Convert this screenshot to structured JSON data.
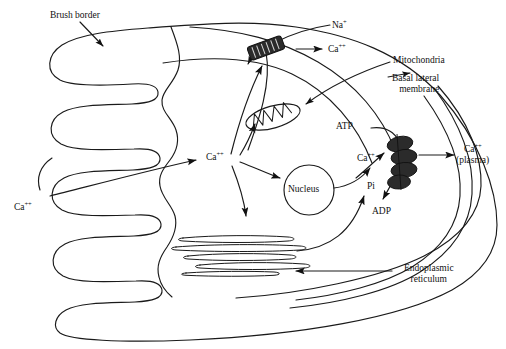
{
  "figure": {
    "background_color": "#ffffff",
    "stroke_color": "#1a1a1a",
    "fill_dark": "#2b2b2b"
  },
  "labels": {
    "brush_border": "Brush border",
    "na_plus": "Na",
    "na_plus_charge": "+",
    "ca_apical": "Ca",
    "ca_apical_charge": "++",
    "mitochondria": "Mitochondria",
    "basal_lateral_membrane_line1": "Basal lateral",
    "basal_lateral_membrane_line2": "membrane",
    "atp": "ATP",
    "adp": "ADP",
    "pi": "Pi",
    "ca_pump_inner": "Ca",
    "ca_pump_inner_charge": "++",
    "ca_plasma_line1": "Ca",
    "ca_plasma_charge": "++",
    "ca_plasma_line2": "(plasma)",
    "ca_lumen": "Ca",
    "ca_lumen_charge": "++",
    "ca_cytosol": "Ca",
    "ca_cytosol_charge": "++",
    "nucleus": "Nucleus",
    "endoplasmic_reticulum_line1": "Endoplasmic",
    "endoplasmic_reticulum_line2": "reticulum"
  },
  "organelles": [
    {
      "name": "brush-border",
      "description": "apical microvilli folds on left side"
    },
    {
      "name": "mitochondrion",
      "description": "elongated oval with internal cristae zigzag"
    },
    {
      "name": "nucleus",
      "description": "circular body in cell center"
    },
    {
      "name": "endoplasmic-reticulum",
      "description": "stack of flattened elongated cisternae"
    },
    {
      "name": "sodium-calcium-exchanger",
      "description": "dark striped channel in apical membrane"
    },
    {
      "name": "calcium-atpase-pump",
      "description": "stack of four dark ellipses in basal lateral membrane"
    }
  ],
  "transport_flows": [
    {
      "species": "Na",
      "charge": "+",
      "direction": "into cell through apical exchanger"
    },
    {
      "species": "Ca",
      "charge": "++",
      "direction": "out of cell through apical exchanger"
    },
    {
      "species": "Ca",
      "charge": "++",
      "direction": "lumen into cytosol across brush border"
    },
    {
      "species": "Ca",
      "charge": "++",
      "direction": "cytosol to mitochondria"
    },
    {
      "species": "Ca",
      "charge": "++",
      "direction": "cytosol to nucleus"
    },
    {
      "species": "Ca",
      "charge": "++",
      "direction": "cytosol to endoplasmic reticulum"
    },
    {
      "species": "Ca",
      "charge": "++",
      "direction": "cytosol to basal lateral pump then to plasma"
    },
    {
      "species": "ATP",
      "charge": "",
      "direction": "to pump"
    },
    {
      "species": "ADP",
      "charge": "",
      "direction": "from pump"
    },
    {
      "species": "Pi",
      "charge": "",
      "direction": "from pump"
    }
  ]
}
